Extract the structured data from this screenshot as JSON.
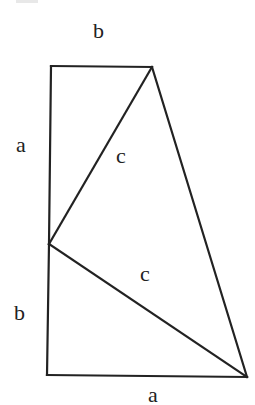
{
  "figure": {
    "stroke_color": "#222222",
    "background_color": "#ffffff",
    "vertices": {
      "top_left": [
        51,
        66
      ],
      "top_right": [
        152,
        67
      ],
      "mid_left": [
        49,
        244
      ],
      "bottom_left": [
        47,
        375
      ],
      "bottom_right": [
        247,
        377
      ]
    },
    "segments": [
      {
        "name": "top-edge-b",
        "from": "top_left",
        "to": "top_right"
      },
      {
        "name": "left-edge-a",
        "from": "top_left",
        "to": "mid_left"
      },
      {
        "name": "left-edge-b",
        "from": "mid_left",
        "to": "bottom_left"
      },
      {
        "name": "bottom-edge-a",
        "from": "bottom_left",
        "to": "bottom_right"
      },
      {
        "name": "hypotenuse-upper-c",
        "from": "mid_left",
        "to": "top_right"
      },
      {
        "name": "hypotenuse-lower-c",
        "from": "mid_left",
        "to": "bottom_right"
      },
      {
        "name": "right-edge",
        "from": "top_right",
        "to": "bottom_right"
      }
    ]
  },
  "labels": {
    "top_b": "b",
    "left_a": "a",
    "upper_c": "c",
    "lower_c": "c",
    "left_b": "b",
    "bottom_a": "a"
  }
}
